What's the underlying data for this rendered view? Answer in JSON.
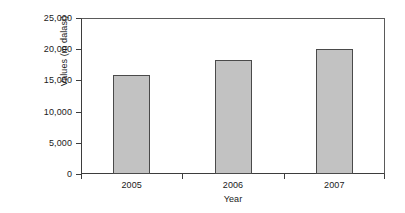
{
  "chart_data": {
    "type": "bar",
    "title": "",
    "subtitle": "",
    "xlabel": "Year",
    "ylabel": "Values (m dalasi)",
    "categories": [
      "2005",
      "2006",
      "2007"
    ],
    "values": [
      15900,
      18300,
      20000
    ],
    "series": [
      {
        "name": "Values (m dalasi)",
        "values": [
          15900,
          18300,
          20000
        ]
      }
    ],
    "ylim": [
      0,
      25000
    ],
    "y_ticks": [
      0,
      5000,
      10000,
      15000,
      20000,
      25000
    ],
    "y_tick_labels": [
      "0",
      "5,000",
      "10,000",
      "15,000",
      "20,000",
      "25,000"
    ],
    "x_tick_labels": [
      "2005",
      "2006",
      "2007"
    ],
    "grid": false,
    "legend": false,
    "legend_position": "none",
    "bar_color": "#c2c2c2",
    "bar_edge_color": "#4a4a4a",
    "axis_color": "#3d3d3d",
    "background_color": "#ffffff",
    "annotations": []
  }
}
